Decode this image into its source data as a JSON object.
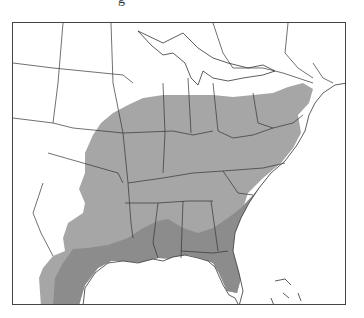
{
  "caption_fragment": "g",
  "map": {
    "region": "Eastern United States",
    "legend": [
      {
        "name": "range",
        "color": "#a6a6a6"
      },
      {
        "name": "core-range",
        "color": "#8c8c8c"
      }
    ],
    "colors": {
      "land": "#ffffff",
      "border": "#333333",
      "range": "#a6a6a6",
      "core": "#8c8c8c",
      "water": "#ffffff"
    }
  }
}
